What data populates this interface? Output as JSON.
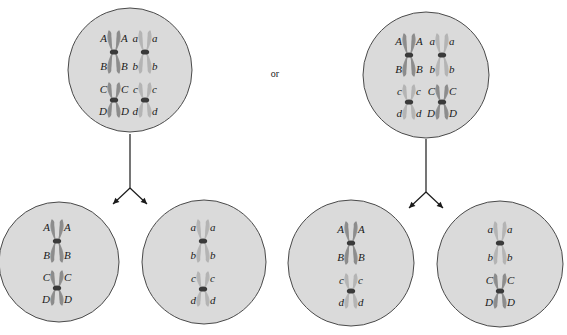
{
  "diagram": {
    "separator_text": "or",
    "colors": {
      "background": "#ffffff",
      "cell_fill": "#dadada",
      "cell_stroke": "#4a4a4a",
      "chromosome_uppercase": "#8c8c8c",
      "chromosome_lowercase": "#b4b4b4",
      "centromere": "#3a3a3a",
      "arrow": "#1a1a1a",
      "label": "#1a1a1a"
    },
    "scenarios": [
      {
        "name": "scenario-1",
        "parent_cell": {
          "cx": 130,
          "cy": 70,
          "r": 62,
          "chromosomes": [
            {
              "x": 114,
              "cy": 52,
              "half": 22,
              "tone": "upper",
              "labels": [
                "A",
                "B"
              ],
              "offset": 0
            },
            {
              "x": 145,
              "cy": 52,
              "half": 22,
              "tone": "lower",
              "labels": [
                "a",
                "b"
              ],
              "offset": 0
            },
            {
              "x": 114,
              "cy": 100,
              "half": 18,
              "tone": "upper",
              "labels": [
                "C",
                "D"
              ],
              "offset": 0
            },
            {
              "x": 145,
              "cy": 100,
              "half": 18,
              "tone": "lower",
              "labels": [
                "c",
                "d"
              ],
              "offset": 0
            }
          ]
        },
        "arrow": {
          "x": 130,
          "top": 134,
          "fork_y": 188,
          "left_tip": [
            113,
            204
          ],
          "right_tip": [
            147,
            204
          ]
        },
        "daughter_cells": [
          {
            "cx": 59,
            "cy": 262,
            "r": 60,
            "chromosomes": [
              {
                "x": 57,
                "cy": 241,
                "half": 22,
                "tone": "upper",
                "labels": [
                  "A",
                  "B"
                ]
              },
              {
                "x": 57,
                "cy": 288,
                "half": 18,
                "tone": "upper",
                "labels": [
                  "C",
                  "D"
                ]
              }
            ]
          },
          {
            "cx": 204,
            "cy": 262,
            "r": 62,
            "chromosomes": [
              {
                "x": 203,
                "cy": 241,
                "half": 22,
                "tone": "lower",
                "labels": [
                  "a",
                  "b"
                ]
              },
              {
                "x": 203,
                "cy": 289,
                "half": 18,
                "tone": "lower",
                "labels": [
                  "c",
                  "d"
                ]
              }
            ]
          }
        ]
      },
      {
        "name": "scenario-2",
        "parent_cell": {
          "cx": 426,
          "cy": 75,
          "r": 63,
          "chromosomes": [
            {
              "x": 409,
              "cy": 55,
              "half": 22,
              "tone": "upper",
              "labels": [
                "A",
                "B"
              ]
            },
            {
              "x": 442,
              "cy": 55,
              "half": 22,
              "tone": "lower",
              "labels": [
                "a",
                "b"
              ]
            },
            {
              "x": 409,
              "cy": 102,
              "half": 18,
              "tone": "lower",
              "labels": [
                "c",
                "d"
              ]
            },
            {
              "x": 442,
              "cy": 102,
              "half": 18,
              "tone": "upper",
              "labels": [
                "C",
                "D"
              ]
            }
          ]
        },
        "arrow": {
          "x": 426,
          "top": 139,
          "fork_y": 192,
          "left_tip": [
            409,
            208
          ],
          "right_tip": [
            443,
            208
          ]
        },
        "daughter_cells": [
          {
            "cx": 351,
            "cy": 263,
            "r": 63,
            "chromosomes": [
              {
                "x": 351,
                "cy": 243,
                "half": 22,
                "tone": "upper",
                "labels": [
                  "A",
                  "B"
                ]
              },
              {
                "x": 351,
                "cy": 291,
                "half": 18,
                "tone": "lower",
                "labels": [
                  "c",
                  "d"
                ]
              }
            ]
          },
          {
            "cx": 500,
            "cy": 264,
            "r": 63,
            "chromosomes": [
              {
                "x": 500,
                "cy": 243,
                "half": 22,
                "tone": "lower",
                "labels": [
                  "a",
                  "b"
                ]
              },
              {
                "x": 500,
                "cy": 291,
                "half": 18,
                "tone": "upper",
                "labels": [
                  "C",
                  "D"
                ]
              }
            ]
          }
        ]
      }
    ],
    "or_position": {
      "x": 275,
      "y": 77
    }
  }
}
